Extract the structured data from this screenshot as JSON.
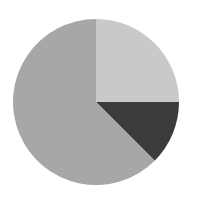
{
  "chart_data": {
    "type": "pie",
    "title": "",
    "start_angle_deg": 0,
    "direction": "clockwise",
    "slices": [
      {
        "label": "",
        "value": 25,
        "color": "#c9c9c9"
      },
      {
        "label": "",
        "value": 12.5,
        "color": "#3b3b3b"
      },
      {
        "label": "",
        "value": 62.5,
        "color": "#a7a7a7"
      }
    ],
    "legend": null,
    "center": [
      96,
      102
    ],
    "radius": 83
  }
}
